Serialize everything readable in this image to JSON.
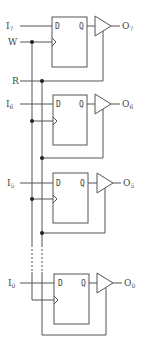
{
  "diagram": {
    "type": "register-with-tristate-outputs",
    "signals": {
      "write": "W",
      "read": "R"
    },
    "stages": [
      {
        "input": "I",
        "input_sub": "7",
        "output": "O",
        "output_sub": "7",
        "d_label": "D",
        "q_label": "Q"
      },
      {
        "input": "I",
        "input_sub": "6",
        "output": "O",
        "output_sub": "6",
        "d_label": "D",
        "q_label": "Q"
      },
      {
        "input": "I",
        "input_sub": "5",
        "output": "O",
        "output_sub": "5",
        "d_label": "D",
        "q_label": "Q"
      },
      {
        "input": "I",
        "input_sub": "0",
        "output": "O",
        "output_sub": "0",
        "d_label": "D",
        "q_label": "Q"
      }
    ],
    "colors": {
      "line": "#555555",
      "junction": "#222222",
      "text": "#444444"
    }
  }
}
